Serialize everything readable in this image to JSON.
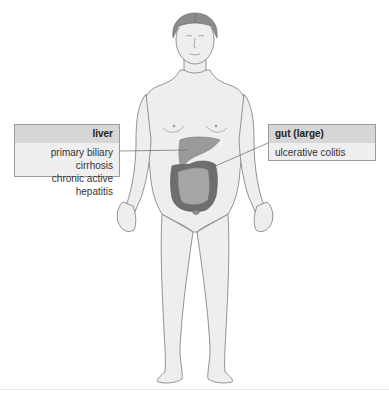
{
  "diagram": {
    "colors": {
      "skin_fill": "#eeeeee",
      "outline": "#7a7a7a",
      "hair": "#8c8c8c",
      "liver": "#9a9a9a",
      "colon": "#6e6e6e",
      "small_intestine": "#a6a6a6",
      "label_header_bg": "#d6d6d6",
      "label_body_bg": "#efefef"
    }
  },
  "labels": [
    {
      "organ": "liver",
      "title": "liver",
      "items": [
        "primary biliary cirrhosis",
        "chronic active hepatitis"
      ]
    },
    {
      "organ": "gut-large",
      "title": "gut (large)",
      "items": [
        "ulcerative colitis"
      ]
    }
  ]
}
